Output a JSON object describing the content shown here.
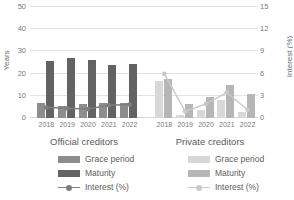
{
  "chart_data": {
    "type": "bar",
    "title": "",
    "xlabel": "",
    "ylabel": "Years",
    "y2label": "Interest (%)",
    "ylim": [
      0,
      50
    ],
    "y2lim": [
      0,
      15
    ],
    "yticks": [
      0,
      10,
      20,
      30,
      40,
      50
    ],
    "y2ticks": [
      0,
      3,
      6,
      9,
      12,
      15
    ],
    "grid": true,
    "legend_position": "bottom",
    "categories": [
      "2018",
      "2019",
      "2020",
      "2021",
      "2022"
    ],
    "groups": [
      {
        "name": "Official creditors",
        "series": [
          {
            "name": "Grace period",
            "unit": "Years",
            "axis": "left",
            "color": "#8d8d8d",
            "values": [
              6.5,
              5.2,
              6.3,
              6.6,
              6.9
            ]
          },
          {
            "name": "Maturity",
            "unit": "Years",
            "axis": "left",
            "color": "#636363",
            "values": [
              25.5,
              27.0,
              26.0,
              23.5,
              24.2
            ]
          },
          {
            "name": "Interest (%)",
            "unit": "%",
            "axis": "right",
            "color": "#7d7d7d",
            "values": [
              1.4,
              1.3,
              1.2,
              1.7,
              1.8
            ]
          }
        ]
      },
      {
        "name": "Private creditors",
        "series": [
          {
            "name": "Grace period",
            "unit": "Years",
            "axis": "left",
            "color": "#d8d8d8",
            "values": [
              16.5,
              1.4,
              3.6,
              7.9,
              2.6
            ]
          },
          {
            "name": "Maturity",
            "unit": "Years",
            "axis": "left",
            "color": "#b6b6b6",
            "values": [
              17.3,
              6.2,
              9.2,
              14.6,
              10.9
            ]
          },
          {
            "name": "Interest (%)",
            "unit": "%",
            "axis": "right",
            "color": "#c9c9c9",
            "values": [
              5.9,
              0.9,
              1.9,
              3.4,
              1.1
            ]
          }
        ]
      }
    ]
  },
  "axes": {
    "left_title": "Years",
    "right_title": "Interest (%)",
    "left_ticks": [
      "50",
      "40",
      "30",
      "20",
      "10",
      "0"
    ],
    "right_ticks": [
      "15",
      "12",
      "9",
      "6",
      "3",
      "0"
    ]
  },
  "groups": {
    "official": {
      "title": "Official creditors",
      "xlabels": [
        "2018",
        "2019",
        "2020",
        "2021",
        "2022"
      ],
      "legend": [
        {
          "label": "Grace period",
          "type": "swatch",
          "color": "#8d8d8d"
        },
        {
          "label": "Maturity",
          "type": "swatch",
          "color": "#636363"
        },
        {
          "label": "Interest (%)",
          "type": "line",
          "color": "#7d7d7d"
        }
      ]
    },
    "private": {
      "title": "Private creditors",
      "xlabels": [
        "2018",
        "2019",
        "2020",
        "2021",
        "2022"
      ],
      "legend": [
        {
          "label": "Grace period",
          "type": "swatch",
          "color": "#d8d8d8"
        },
        {
          "label": "Maturity",
          "type": "swatch",
          "color": "#b6b6b6"
        },
        {
          "label": "Interest (%)",
          "type": "line",
          "color": "#c9c9c9"
        }
      ]
    }
  }
}
